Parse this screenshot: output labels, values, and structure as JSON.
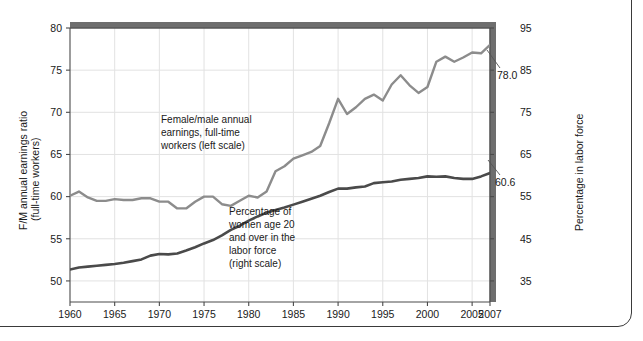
{
  "chart_data": {
    "type": "line",
    "title": "",
    "subtitle": "",
    "xlabel": "",
    "grid": true,
    "legend_position": "inline-annotations",
    "x": [
      1960,
      1961,
      1962,
      1963,
      1964,
      1965,
      1966,
      1967,
      1968,
      1969,
      1970,
      1971,
      1972,
      1973,
      1974,
      1975,
      1976,
      1977,
      1978,
      1979,
      1980,
      1981,
      1982,
      1983,
      1984,
      1985,
      1986,
      1987,
      1988,
      1989,
      1990,
      1991,
      1992,
      1993,
      1994,
      1995,
      1996,
      1997,
      1998,
      1999,
      2000,
      2001,
      2002,
      2003,
      2004,
      2005,
      2006,
      2007
    ],
    "x_tick_labels": [
      "1960",
      "1965",
      "1970",
      "1975",
      "1980",
      "1985",
      "1990",
      "1995",
      "2000",
      "2005",
      "2007"
    ],
    "x_ticks": [
      1960,
      1965,
      1970,
      1975,
      1980,
      1985,
      1990,
      1995,
      2000,
      2005,
      2007
    ],
    "xlim": [
      1960,
      2007
    ],
    "axes": [
      {
        "side": "left",
        "label_line1": "F/M annual earnings ratio",
        "label_line2": "(full-time workers)",
        "ticks": [
          50,
          55,
          60,
          65,
          70,
          75,
          80
        ],
        "tick_labels": [
          "50",
          "55",
          "60",
          "65",
          "70",
          "75",
          "80"
        ],
        "lim": [
          47.5,
          80
        ]
      },
      {
        "side": "right",
        "label": "Percentage in labor force",
        "ticks": [
          35,
          45,
          55,
          65,
          75,
          85,
          95
        ],
        "tick_labels": [
          "35",
          "45",
          "55",
          "65",
          "75",
          "85",
          "95"
        ],
        "lim": [
          30,
          95
        ]
      }
    ],
    "series": [
      {
        "name": "Female/male annual earnings, full-time workers",
        "axis": "left",
        "color": "#8c8c8c",
        "annotation_lines": [
          "Female/male annual",
          "earnings, full-time",
          "workers (left scale)"
        ],
        "end_label": "78.0",
        "values": [
          60.1,
          60.6,
          59.9,
          59.5,
          59.5,
          59.7,
          59.6,
          59.6,
          59.8,
          59.8,
          59.4,
          59.4,
          58.6,
          58.6,
          59.4,
          60.0,
          60.0,
          59.1,
          58.9,
          59.5,
          60.1,
          59.9,
          60.6,
          63.0,
          63.6,
          64.5,
          64.9,
          65.3,
          66.0,
          68.7,
          71.6,
          69.8,
          70.6,
          71.6,
          72.1,
          71.4,
          73.3,
          74.4,
          73.2,
          72.3,
          73.0,
          76.0,
          76.6,
          76.0,
          76.5,
          77.1,
          77.0,
          78.0
        ]
      },
      {
        "name": "Percentage of women age 20 and over in the labor force",
        "axis": "right",
        "color": "#4a4a4a",
        "annotation_lines": [
          "Percentage of",
          "women age 20",
          "and over in the",
          "labor force",
          "(right scale)"
        ],
        "end_label": "60.6",
        "values": [
          37.7,
          38.2,
          38.4,
          38.6,
          38.8,
          39.0,
          39.3,
          39.7,
          40.1,
          41.0,
          41.4,
          41.3,
          41.5,
          42.2,
          43.0,
          43.9,
          44.7,
          45.8,
          47.1,
          48.1,
          49.3,
          50.3,
          51.2,
          51.8,
          52.4,
          53.1,
          53.8,
          54.5,
          55.2,
          56.1,
          56.9,
          56.9,
          57.2,
          57.4,
          58.2,
          58.4,
          58.6,
          59.0,
          59.2,
          59.4,
          59.8,
          59.7,
          59.8,
          59.4,
          59.2,
          59.2,
          59.8,
          60.6
        ]
      }
    ]
  }
}
